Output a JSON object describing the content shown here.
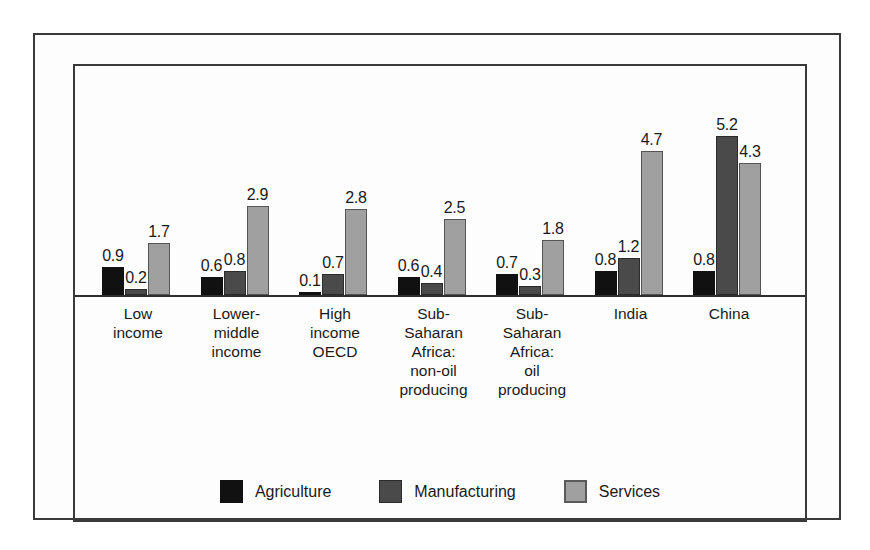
{
  "chart_data": {
    "type": "bar",
    "title": "",
    "subtitle": "",
    "xlabel": "",
    "ylabel": "",
    "ylim": [
      0,
      5.6
    ],
    "grid": false,
    "legend_position": "bottom-center",
    "categories": [
      "Low income",
      "Lower-middle income",
      "High income OECD",
      "Sub-Saharan Africa: non-oil producing",
      "Sub-Saharan Africa: oil producing",
      "India",
      "China"
    ],
    "category_lines": [
      [
        "Low",
        "income"
      ],
      [
        "Lower-",
        "middle",
        "income"
      ],
      [
        "High",
        "income",
        "OECD"
      ],
      [
        "Sub-",
        "Saharan",
        "Africa:",
        "non-oil",
        "producing"
      ],
      [
        "Sub-",
        "Saharan",
        "Africa:",
        "oil",
        "producing"
      ],
      [
        "India"
      ],
      [
        "China"
      ]
    ],
    "series": [
      {
        "name": "Agriculture",
        "color": "#111111",
        "values": [
          0.9,
          0.6,
          0.1,
          0.6,
          0.7,
          0.8,
          0.8
        ],
        "labels": [
          "0.9",
          "0.6",
          "0.1",
          "0.6",
          "0.7",
          "0.8",
          "0.8"
        ]
      },
      {
        "name": "Manufacturing",
        "color": "#4a4a4a",
        "values": [
          0.2,
          0.8,
          0.7,
          0.4,
          0.3,
          1.2,
          5.2
        ],
        "labels": [
          "0.2",
          "0.8",
          "0.7",
          "0.4",
          "0.3",
          "1.2",
          "5.2"
        ]
      },
      {
        "name": "Services",
        "color": "#a0a0a0",
        "values": [
          1.7,
          2.9,
          2.8,
          2.5,
          1.8,
          4.7,
          4.3
        ],
        "labels": [
          "1.7",
          "2.9",
          "2.8",
          "2.5",
          "1.8",
          "4.7",
          "4.3"
        ]
      }
    ]
  },
  "legend": {
    "items": [
      {
        "label": "Agriculture",
        "swatch_class": "agri"
      },
      {
        "label": "Manufacturing",
        "swatch_class": "manu"
      },
      {
        "label": "Services",
        "swatch_class": "serv"
      }
    ]
  },
  "colors": {
    "agriculture": "#111111",
    "manufacturing": "#4a4a4a",
    "services": "#a0a0a0",
    "frame": "#3a3a3a",
    "axis": "#2e2e2e",
    "background": "#ffffff",
    "text": "#1a1a1a"
  }
}
